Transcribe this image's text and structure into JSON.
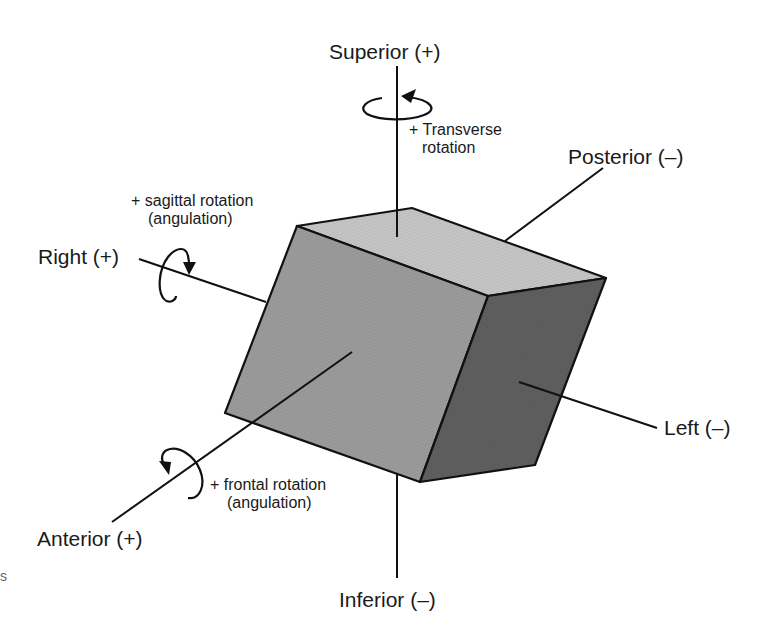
{
  "diagram": {
    "axes": {
      "superior": "Superior (+)",
      "inferior": "Inferior (–)",
      "right": "Right (+)",
      "left": "Left (–)",
      "anterior": "Anterior (+)",
      "posterior": "Posterior (–)"
    },
    "rotations": {
      "transverse": {
        "line1": "+ Transverse",
        "line2": "rotation"
      },
      "sagittal": {
        "line1": "+ sagittal rotation",
        "line2": "(angulation)"
      },
      "frontal": {
        "line1": "+ frontal rotation",
        "line2": "(angulation)"
      }
    },
    "stray_mark": "s",
    "colors": {
      "top_face": "#c4c4c4",
      "front_face": "#9a9a9a",
      "side_face": "#5e5e5e",
      "line": "#111111"
    }
  }
}
